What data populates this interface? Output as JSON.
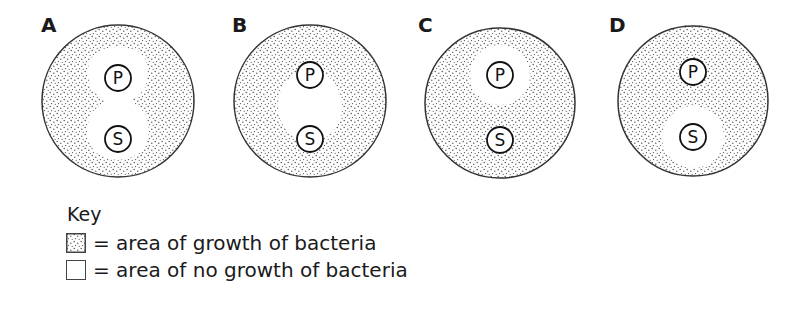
{
  "diagram": {
    "type": "agar plate diagrams",
    "dishes": [
      {
        "label": "A",
        "discs": [
          "P",
          "S"
        ],
        "clear_zone": "hourglass shape around both P and S, merged"
      },
      {
        "label": "B",
        "discs": [
          "P",
          "S"
        ],
        "clear_zone": "single oval region between P and S"
      },
      {
        "label": "C",
        "discs": [
          "P",
          "S"
        ],
        "clear_zone": "circle around P only"
      },
      {
        "label": "D",
        "discs": [
          "P",
          "S"
        ],
        "clear_zone": "circle around S only"
      }
    ]
  },
  "key": {
    "title": "Key",
    "items": [
      {
        "swatch": "stippled",
        "text": "= area of growth of bacteria"
      },
      {
        "swatch": "blank",
        "text": "= area of no growth of bacteria"
      }
    ]
  },
  "colors": {
    "ink": "#1a1a1a",
    "stipple": "#555555",
    "background": "#ffffff"
  }
}
